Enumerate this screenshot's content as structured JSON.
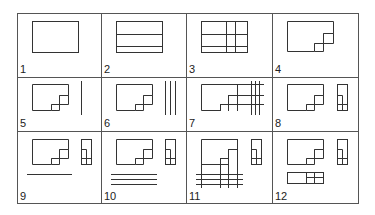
{
  "figure": {
    "grid": {
      "columns": 4,
      "rows": 3,
      "x_edges": [
        17,
        101,
        186,
        272,
        359
      ],
      "y_edges": [
        13,
        77,
        131,
        204
      ]
    },
    "cells": [
      {
        "label": "1",
        "description": "Single rectangle"
      },
      {
        "label": "2",
        "description": "Rectangle divided by two horizontal lines"
      },
      {
        "label": "3",
        "description": "Rectangle divided by two horizontal and two vertical lines"
      },
      {
        "label": "4",
        "description": "Rectangle with stepped notch at lower right"
      },
      {
        "label": "5",
        "description": "Stepped shape plus one vertical line"
      },
      {
        "label": "6",
        "description": "Stepped shape plus three vertical lines"
      },
      {
        "label": "7",
        "description": "Stepped shape with grid of extended lines"
      },
      {
        "label": "8",
        "description": "Stepped shape plus side elevation view"
      },
      {
        "label": "9",
        "description": "Stepped shape, side view, and one horizontal line below"
      },
      {
        "label": "10",
        "description": "Stepped shape, side view, and three horizontal lines below"
      },
      {
        "label": "11",
        "description": "Stepped shape with extended projection grid and side view"
      },
      {
        "label": "12",
        "description": "Stepped shape, side view, and bottom plan view"
      }
    ]
  }
}
